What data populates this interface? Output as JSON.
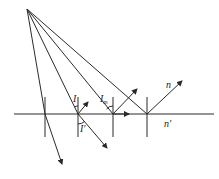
{
  "diagram": {
    "labels": {
      "incident_angle": "I",
      "refraction_angle": "I′",
      "critical_angle": "I",
      "critical_sub": "m",
      "medium_upper": "n",
      "medium_lower": "n′"
    },
    "colors": {
      "line": "#2a2a2a",
      "background": "#ffffff"
    },
    "source_point": [
      27,
      9
    ],
    "interface_y": 114,
    "normals_x": [
      45,
      78,
      113,
      147
    ]
  }
}
